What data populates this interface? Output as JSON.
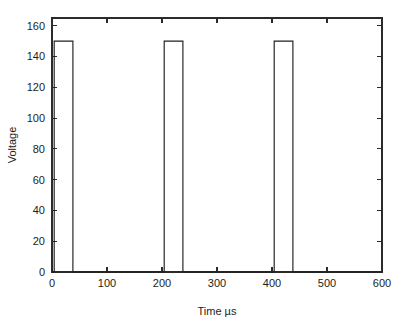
{
  "chart_data": {
    "type": "line",
    "title": "",
    "subtitle": "",
    "xlabel": "Time µs",
    "ylabel": "Voltage",
    "xlim": [
      0,
      600
    ],
    "ylim": [
      0,
      165
    ],
    "xticks": [
      0,
      100,
      200,
      300,
      400,
      500,
      600
    ],
    "yticks": [
      0,
      20,
      40,
      60,
      80,
      100,
      120,
      140,
      160
    ],
    "xticklabels": [
      "0",
      "100",
      "200",
      "300",
      "400",
      "500",
      "600"
    ],
    "yticklabels": [
      "0",
      "20",
      "40",
      "60",
      "80",
      "100",
      "120",
      "140",
      "160"
    ],
    "grid": false,
    "legend": null,
    "box": true,
    "tick_direction": "in",
    "line_color": "#1f1f1f",
    "axis_color": "#2b2b2b",
    "background_color": "#ffffff",
    "series": [
      {
        "name": "Voltage pulse train",
        "x": [
          0,
          4,
          4,
          38,
          38,
          204,
          204,
          238,
          238,
          404,
          404,
          438,
          438,
          600
        ],
        "y": [
          0,
          0,
          150,
          150,
          0,
          0,
          150,
          150,
          0,
          0,
          150,
          150,
          0,
          0
        ]
      }
    ],
    "pulses": [
      {
        "rise": 4,
        "fall": 38,
        "amplitude": 150,
        "baseline": 0
      },
      {
        "rise": 204,
        "fall": 238,
        "amplitude": 150,
        "baseline": 0
      },
      {
        "rise": 404,
        "fall": 438,
        "amplitude": 150,
        "baseline": 0
      }
    ],
    "annotations": []
  },
  "axes": {
    "x_title": "Time µs",
    "y_title": "Voltage"
  }
}
